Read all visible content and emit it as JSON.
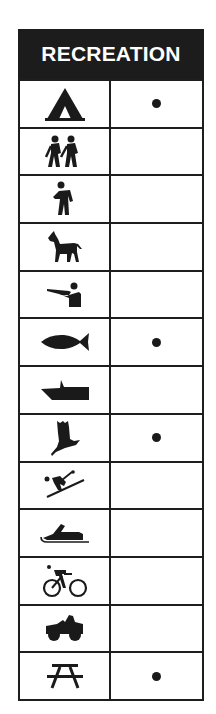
{
  "header": {
    "title": "RECREATION"
  },
  "colors": {
    "ink": "#1a1a1a",
    "header_bg": "#1c1c1c",
    "header_text": "#ffffff",
    "background": "#ffffff"
  },
  "rows": [
    {
      "activity_icon": "tent-camping-icon",
      "available": true
    },
    {
      "activity_icon": "hiking-pair-icon",
      "available": false
    },
    {
      "activity_icon": "hiker-icon",
      "available": false
    },
    {
      "activity_icon": "horseback-riding-icon",
      "available": false
    },
    {
      "activity_icon": "hunting-rifle-icon",
      "available": false
    },
    {
      "activity_icon": "fishing-fish-icon",
      "available": true
    },
    {
      "activity_icon": "boating-icon",
      "available": false
    },
    {
      "activity_icon": "bird-watching-icon",
      "available": true
    },
    {
      "activity_icon": "skiing-icon",
      "available": false
    },
    {
      "activity_icon": "snowmobile-icon",
      "available": false
    },
    {
      "activity_icon": "bicycling-icon",
      "available": false
    },
    {
      "activity_icon": "off-road-vehicle-icon",
      "available": false
    },
    {
      "activity_icon": "picnic-table-icon",
      "available": true
    }
  ]
}
